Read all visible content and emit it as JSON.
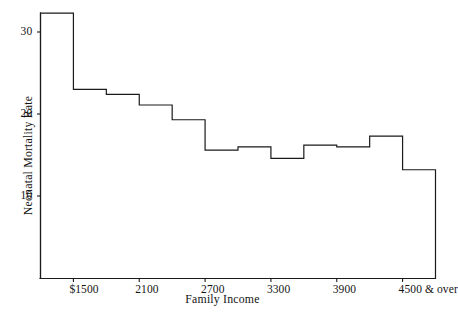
{
  "chart_data": {
    "type": "bar",
    "title": "",
    "subtitle": "",
    "xlabel": "Family Income",
    "ylabel": "Neonatal Mortality Rate",
    "style": "step-histogram",
    "grid": false,
    "legend": null,
    "legend_position": "none",
    "xlim": [
      1200,
      4800
    ],
    "ylim": [
      0,
      34
    ],
    "ytick_labels": [
      "30",
      "20",
      "10"
    ],
    "ytick_values": [
      30,
      20,
      10
    ],
    "xtick_labels": [
      "$1500",
      "2100",
      "2700",
      "3300",
      "3900",
      "4500 & over"
    ],
    "xtick_values": [
      1500,
      2100,
      2700,
      3300,
      3900,
      4500
    ],
    "categories": [
      "under 1500",
      "1500-1799",
      "1800-2099",
      "2100-2399",
      "2400-2699",
      "2700-2999",
      "3000-3299",
      "3300-3599",
      "3600-3899",
      "3900-4199",
      "4200-4499",
      "4500 & over"
    ],
    "values": [
      32.3,
      23.0,
      22.4,
      21.1,
      19.3,
      15.6,
      16.0,
      14.6,
      16.2,
      16.0,
      17.3,
      13.2
    ],
    "bin_edges": [
      1200,
      1500,
      1800,
      2100,
      2400,
      2700,
      3000,
      3300,
      3600,
      3900,
      4200,
      4500,
      4800
    ],
    "series": [
      {
        "name": "Neonatal Mortality Rate",
        "values": [
          32.3,
          23.0,
          22.4,
          21.1,
          19.3,
          15.6,
          16.0,
          14.6,
          16.2,
          16.0,
          17.3,
          13.2
        ]
      }
    ],
    "line_color": "#1a1a1a",
    "background_color": "#ffffff"
  },
  "axes": {
    "y_axis_name": "neonatal-mortality-rate-axis",
    "x_axis_name": "family-income-axis"
  }
}
